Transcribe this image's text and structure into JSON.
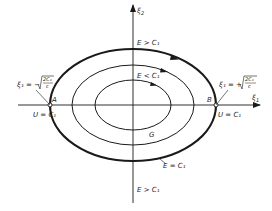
{
  "figure": {
    "axes": {
      "vertical_label": "ξ",
      "vertical_label_sub": "2",
      "horizontal_label": "ξ",
      "horizontal_label_sub": "1"
    },
    "points": {
      "A": "A",
      "B": "B"
    },
    "annotations": {
      "left_xi_expr": "ξ₁ = −",
      "left_sqrt_num": "2C₁",
      "left_sqrt_den": "c",
      "right_xi_expr": "ξ₁ = +",
      "right_sqrt_num": "2C₁",
      "right_sqrt_den": "c",
      "left_potential": "U = C₁",
      "right_potential": "U = C₁",
      "top_energy": "E > C₁",
      "inner_energy": "E < C₁",
      "region_label": "G",
      "separatrix_energy": "E = C₁",
      "bottom_energy": "E > C₁"
    },
    "curves": [
      {
        "name": "separatrix",
        "label": "E = C₁",
        "rx": 83,
        "ry": 56,
        "stroke_width": 2.2
      },
      {
        "name": "middle-orbit",
        "label": "E < C₁",
        "rx": 61,
        "ry": 40,
        "stroke_width": 1
      },
      {
        "name": "inner-orbit",
        "label": "E < C₁",
        "rx": 38,
        "ry": 25,
        "stroke_width": 1
      }
    ],
    "colors": {
      "ink": "#1a1a1a",
      "background": "#ffffff"
    }
  }
}
